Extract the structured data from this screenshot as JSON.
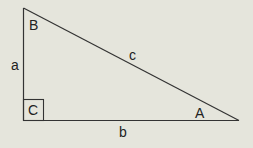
{
  "diagram": {
    "background": "#e5e5dc",
    "stroke_color": "#333333",
    "vertices": {
      "B": {
        "x": 23,
        "y": 8
      },
      "C": {
        "x": 23,
        "y": 120
      },
      "A": {
        "x": 239,
        "y": 120
      }
    },
    "labels": {
      "angle_B": "B",
      "angle_C": "C",
      "angle_A": "A",
      "side_a": "a",
      "side_b": "b",
      "side_c": "c"
    },
    "right_angle_box": {
      "x": 23,
      "y": 99,
      "size": 21
    }
  }
}
